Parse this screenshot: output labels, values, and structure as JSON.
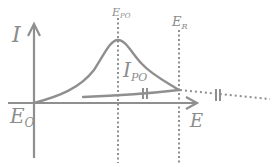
{
  "diagram": {
    "type": "cyclic-voltammetry-sketch",
    "colors": {
      "line": "#8f8f8f",
      "text": "#8c8c8c",
      "background": "#ffffff"
    },
    "axes": {
      "y_label": "I",
      "x_label": "E",
      "origin_label": "E",
      "origin_sub": "O"
    },
    "markers": [
      {
        "label": "E",
        "sub": "PO"
      },
      {
        "label": "E",
        "sub": "R"
      }
    ],
    "curve_label": {
      "label": "I",
      "sub": "PO"
    }
  }
}
